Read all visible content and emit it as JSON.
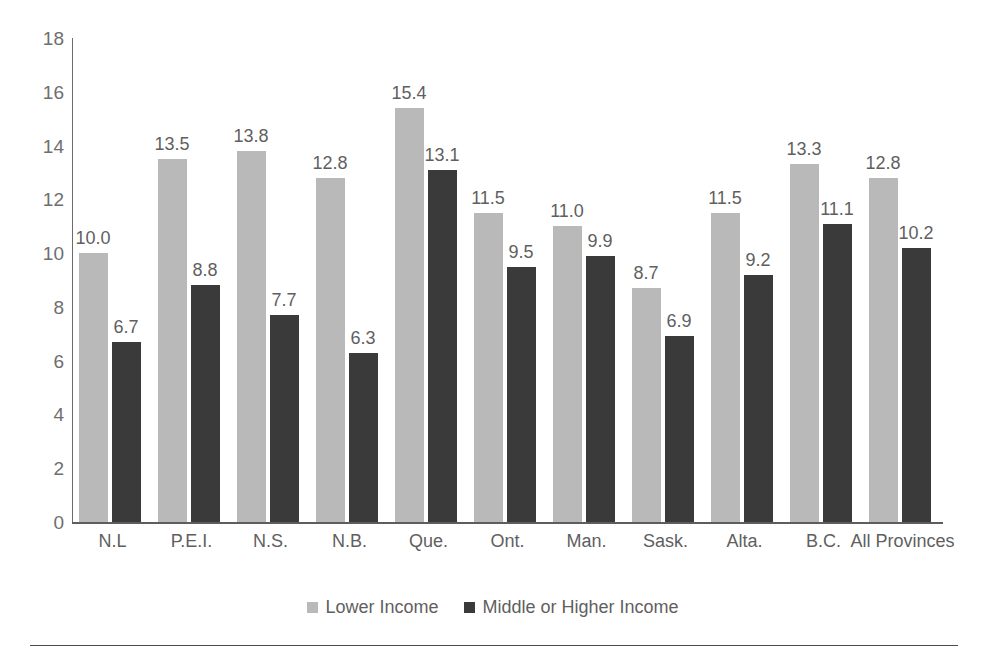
{
  "chart_data": {
    "type": "bar",
    "title": "",
    "subtitle": "",
    "xlabel": "",
    "ylabel": "",
    "ylim": [
      0,
      18
    ],
    "ytick_step": 2,
    "yticks": [
      "18",
      "16",
      "14",
      "12",
      "10",
      "8",
      "6",
      "4",
      "2",
      "0"
    ],
    "grid": false,
    "legend_position": "bottom-center",
    "categories": [
      "N.L",
      "P.E.I.",
      "N.S.",
      "N.B.",
      "Que.",
      "Ont.",
      "Man.",
      "Sask.",
      "Alta.",
      "B.C.",
      "All Provinces"
    ],
    "series": [
      {
        "name": "Lower Income",
        "color": "#b9b9b9",
        "values": [
          10.0,
          13.5,
          13.8,
          12.8,
          15.4,
          11.5,
          11.0,
          8.7,
          11.5,
          13.3,
          12.8
        ],
        "labels": [
          "10.0",
          "13.5",
          "13.8",
          "12.8",
          "15.4",
          "11.5",
          "11.0",
          "8.7",
          "11.5",
          "13.3",
          "12.8"
        ]
      },
      {
        "name": "Middle or Higher Income",
        "color": "#3a3a3a",
        "values": [
          6.7,
          8.8,
          7.7,
          6.3,
          13.1,
          9.5,
          9.9,
          6.9,
          9.2,
          11.1,
          10.2
        ],
        "labels": [
          "6.7",
          "8.8",
          "7.7",
          "6.3",
          "13.1",
          "9.5",
          "9.9",
          "6.9",
          "9.2",
          "11.1",
          "10.2"
        ]
      }
    ]
  },
  "legend": {
    "items": [
      {
        "label": "Lower Income",
        "color": "#b9b9b9"
      },
      {
        "label": "Middle or Higher Income",
        "color": "#3a3a3a"
      }
    ]
  },
  "colors": {
    "series_lower": "#b9b9b9",
    "series_middle_higher": "#3a3a3a",
    "axis": "#5d5d5d",
    "text": "#5f5f5f",
    "background": "#ffffff"
  }
}
